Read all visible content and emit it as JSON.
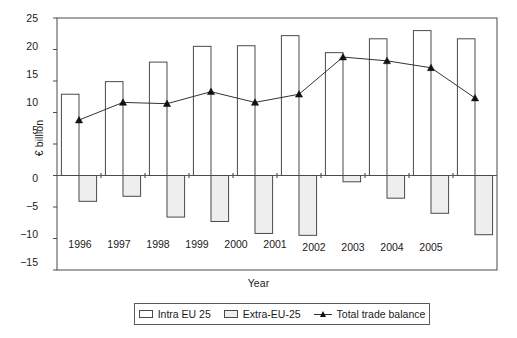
{
  "chart_data": {
    "type": "bar",
    "title": "",
    "xlabel": "Year",
    "ylabel": "€ billion",
    "categories": [
      "1996",
      "1997",
      "1998",
      "1999",
      "2000",
      "2001",
      "2002",
      "2003",
      "2004",
      "2005"
    ],
    "ylim": [
      -15,
      25
    ],
    "yticks": [
      25,
      20,
      15,
      10,
      5,
      0,
      -5,
      -10,
      -15
    ],
    "ytick_labels": [
      "25",
      "20",
      "15",
      "10",
      "5",
      "0",
      "−5",
      "−10",
      "−15"
    ],
    "grid": false,
    "legend_position": "bottom",
    "series": [
      {
        "name": "Intra EU 25",
        "type": "bar",
        "color": "#ffffff",
        "edge_color": "#4a4a4a",
        "values": [
          12.9,
          14.9,
          18.0,
          20.5,
          20.6,
          22.2,
          19.5,
          21.7,
          23.0,
          21.7
        ]
      },
      {
        "name": "Extra-EU-25",
        "type": "bar",
        "color": "#eeeeee",
        "edge_color": "#4a4a4a",
        "values": [
          -4.1,
          -3.3,
          -6.6,
          -7.3,
          -9.2,
          -9.5,
          -1.0,
          -3.6,
          -6.0,
          -9.4
        ]
      },
      {
        "name": "Total trade balance",
        "type": "line",
        "color": "#333333",
        "marker": "triangle",
        "values": [
          8.8,
          11.6,
          11.4,
          13.3,
          11.6,
          12.9,
          18.8,
          18.2,
          17.1,
          12.3
        ]
      }
    ]
  },
  "legend": {
    "items": [
      {
        "label": "Intra EU 25",
        "kind": "bar-white"
      },
      {
        "label": "Extra-EU-25",
        "kind": "bar-gray"
      },
      {
        "label": "Total trade balance",
        "kind": "line-marker"
      }
    ]
  },
  "axes": {
    "y_title": "€ billion",
    "x_title": "Year"
  }
}
